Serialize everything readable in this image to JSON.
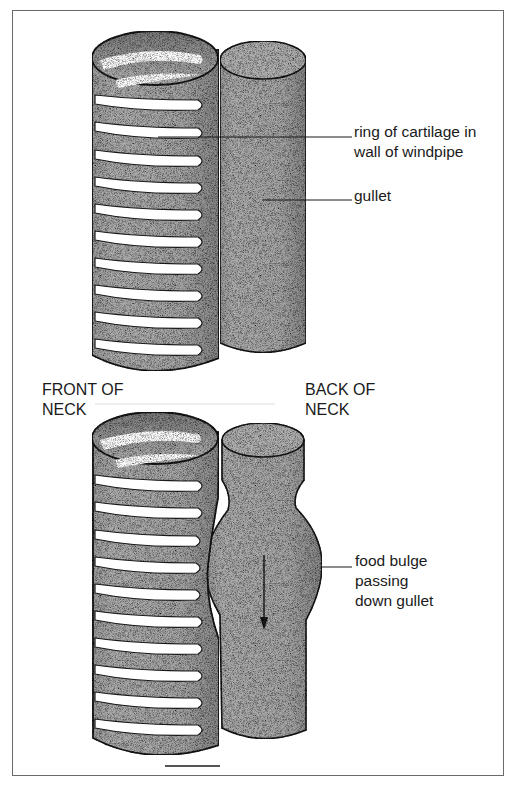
{
  "figure": {
    "top_panel": {
      "labels": {
        "cartilage": [
          "ring of cartilage in",
          "wall of windpipe"
        ],
        "gullet": [
          "gullet"
        ]
      }
    },
    "orientation_labels": {
      "front": [
        "FRONT OF",
        "NECK"
      ],
      "back": [
        "BACK OF",
        "NECK"
      ]
    },
    "bottom_panel": {
      "labels": {
        "food_bulge": [
          "food bulge",
          "passing",
          "down gullet"
        ]
      },
      "arrow_direction": "down"
    },
    "colors": {
      "tube_fill": "#a8a8a8",
      "tube_shade": "#8c8c8c",
      "ring_gap": "#ffffff",
      "outline": "#1a1a1a",
      "frame": "#6a6a6a"
    }
  }
}
